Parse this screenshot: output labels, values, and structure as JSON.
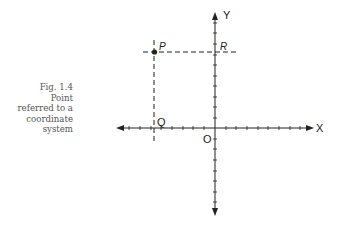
{
  "caption": {
    "figure": "Fig. 1.4",
    "lines": [
      "Point",
      "referred to a",
      "coordinate",
      "system"
    ]
  },
  "diagram": {
    "type": "coordinate-system",
    "axes": {
      "x_label": "X",
      "y_label": "Y",
      "origin_label": "O"
    },
    "points": [
      {
        "label": "P",
        "role": "plotted point",
        "marker": "filled-dot"
      },
      {
        "label": "Q",
        "role": "projection of P on x-axis"
      },
      {
        "label": "R",
        "role": "projection of P on y-axis"
      }
    ],
    "colors": {
      "ink": "#222222",
      "caption": "#555555",
      "background": "#ffffff"
    }
  }
}
